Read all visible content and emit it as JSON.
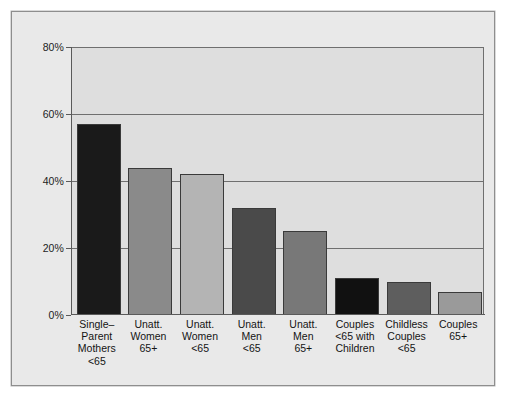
{
  "chart_data": {
    "type": "bar",
    "title": "",
    "subtitle": "",
    "xlabel": "",
    "ylabel": "",
    "ylim": [
      0,
      80
    ],
    "grid": true,
    "legend": false,
    "yticks": [
      "0%",
      "20%",
      "40%",
      "60%",
      "80%"
    ],
    "ytick_values": [
      0,
      20,
      40,
      60,
      80
    ],
    "categories": [
      "Single–Parent Mothers <65",
      "Unatt. Women 65+",
      "Unatt. Women <65",
      "Unatt. Men <65",
      "Unatt. Men 65+",
      "Couples <65 with Children",
      "Childless Couples <65",
      "Couples 65+"
    ],
    "category_lines": [
      [
        "Single–",
        "Parent",
        "Mothers",
        "<65"
      ],
      [
        "Unatt.",
        "Women",
        "65+"
      ],
      [
        "Unatt.",
        "Women",
        "<65"
      ],
      [
        "Unatt.",
        "Men",
        "<65"
      ],
      [
        "Unatt.",
        "Men",
        "65+"
      ],
      [
        "Couples",
        "<65 with",
        "Children"
      ],
      [
        "Childless",
        "Couples",
        "<65"
      ],
      [
        "Couples",
        "65+"
      ]
    ],
    "values": [
      57,
      44,
      42,
      32,
      25,
      11,
      10,
      7
    ],
    "bar_colors": [
      "#1a1a1a",
      "#8a8a8a",
      "#b4b4b4",
      "#4a4a4a",
      "#787878",
      "#111111",
      "#5e5e5e",
      "#9a9a9a"
    ],
    "plot_background": "#dedede",
    "figure_background": "#e9e9e9",
    "axis_color": "#5a5a5a",
    "gridline_color": "#6f6f6f"
  }
}
